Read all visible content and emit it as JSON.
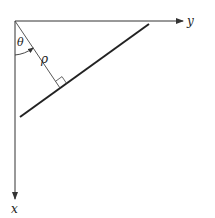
{
  "diagram": {
    "labels": {
      "y_axis": "y",
      "x_axis": "x",
      "angle": "θ",
      "distance": "ρ"
    },
    "colors": {
      "stroke": "#333333",
      "line": "#222222",
      "background": "#ffffff"
    }
  }
}
